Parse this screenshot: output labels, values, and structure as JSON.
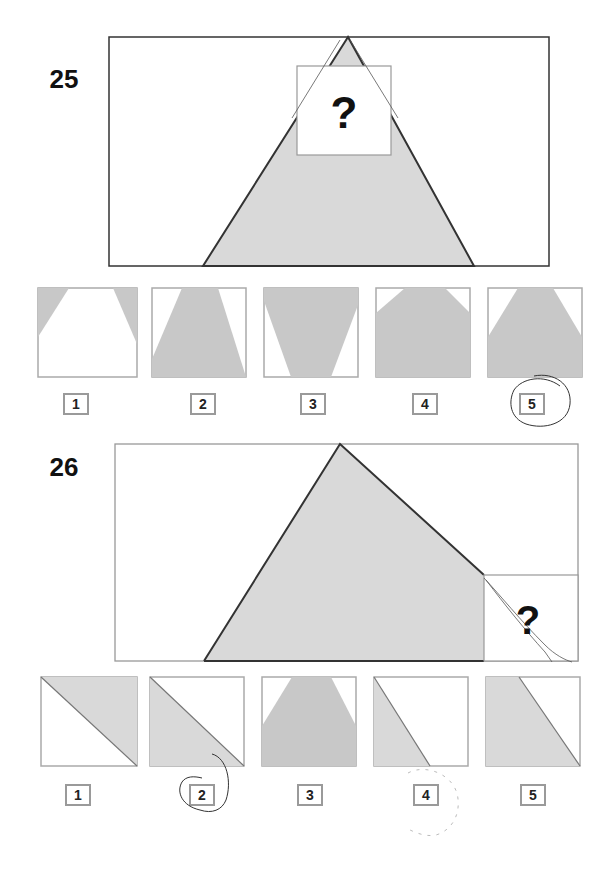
{
  "colors": {
    "shape_fill": "#d9d9d9",
    "option_fill": "#c8c8c8",
    "outline": "#333333",
    "frame_gray": "#999999",
    "pen": "#444444"
  },
  "questions": [
    {
      "number": "25",
      "prompt_symbol": "?",
      "options": [
        {
          "label": "1",
          "description": "white trapezoid, gray top corners"
        },
        {
          "label": "2",
          "description": "gray trapezoid widening downward"
        },
        {
          "label": "3",
          "description": "gray trapezoid narrowing downward"
        },
        {
          "label": "4",
          "description": "gray with small white top corners"
        },
        {
          "label": "5",
          "description": "gray with larger white top corners",
          "circled": true
        }
      ]
    },
    {
      "number": "26",
      "prompt_symbol": "?",
      "options": [
        {
          "label": "1",
          "description": "diagonal, gray upper-right"
        },
        {
          "label": "2",
          "description": "diagonal, gray lower-left",
          "circled": true
        },
        {
          "label": "3",
          "description": "gray with white top corners"
        },
        {
          "label": "4",
          "description": "steep diagonal, gray narrow left"
        },
        {
          "label": "5",
          "description": "steep diagonal, gray wide left"
        }
      ]
    }
  ]
}
